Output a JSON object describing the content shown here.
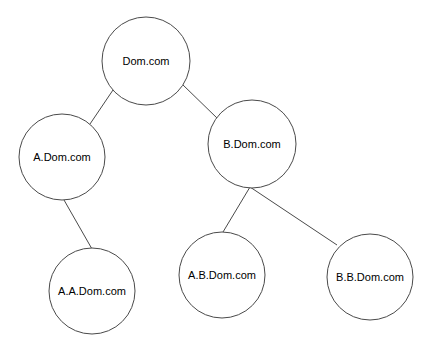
{
  "diagram": {
    "type": "tree",
    "background_color": "#ffffff",
    "stroke_color": "#4a4a4a",
    "text_color": "#000000",
    "nodes": [
      {
        "id": "root",
        "label": "Dom.com",
        "cx": 146,
        "cy": 61,
        "r": 44
      },
      {
        "id": "a",
        "label": "A.Dom.com",
        "cx": 62,
        "cy": 157,
        "r": 43
      },
      {
        "id": "b",
        "label": "B.Dom.com",
        "cx": 252,
        "cy": 144,
        "r": 44
      },
      {
        "id": "aa",
        "label": "A.A.Dom.com",
        "cx": 92,
        "cy": 291,
        "r": 43
      },
      {
        "id": "ab",
        "label": "A.B.Dom.com",
        "cx": 222,
        "cy": 275,
        "r": 43
      },
      {
        "id": "bb",
        "label": "B.B.Dom.com",
        "cx": 370,
        "cy": 277,
        "r": 43
      }
    ],
    "edges": [
      {
        "id": "root-a",
        "from": "root",
        "to": "a",
        "x1": 113,
        "y1": 90,
        "x2": 90,
        "y2": 124
      },
      {
        "id": "root-b",
        "from": "root",
        "to": "b",
        "x1": 182,
        "y1": 84,
        "x2": 218,
        "y2": 119
      },
      {
        "id": "a-aa",
        "from": "a",
        "to": "aa",
        "x1": 64,
        "y1": 200,
        "x2": 92,
        "y2": 249
      },
      {
        "id": "b-ab",
        "from": "b",
        "to": "ab",
        "x1": 250,
        "y1": 187,
        "x2": 223,
        "y2": 232
      },
      {
        "id": "b-bb",
        "from": "b",
        "to": "bb",
        "x1": 250,
        "y1": 187,
        "x2": 337,
        "y2": 245
      }
    ]
  }
}
